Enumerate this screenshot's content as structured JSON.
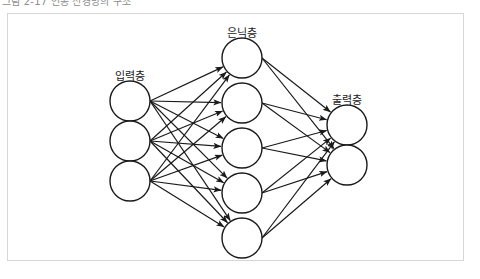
{
  "caption": {
    "text": "그림 2-17 인공 신경망의 구조"
  },
  "figure": {
    "kind": "neural-network-diagram",
    "border_color": "#d6d6d6",
    "background": "#ffffff",
    "stroke_color": "#1a1a1a",
    "node_fill": "#ffffff"
  },
  "labels": {
    "input": "입력층",
    "hidden": "은닉층",
    "output": "출력층"
  },
  "layers": [
    {
      "id": "input",
      "label": "입력층",
      "label_x": 130,
      "label_y": 70,
      "node_count": 3,
      "node_radius": 20,
      "cx": 130,
      "node_cy": [
        101,
        141,
        181
      ]
    },
    {
      "id": "hidden",
      "label": "은닉층",
      "label_x": 242,
      "label_y": 27,
      "node_count": 5,
      "node_radius": 20,
      "cx": 242,
      "node_cy": [
        58,
        103,
        148,
        193,
        238
      ]
    },
    {
      "id": "output",
      "label": "출력층",
      "label_x": 347,
      "label_y": 94,
      "node_count": 2,
      "node_radius": 20,
      "cx": 347,
      "node_cy": [
        125,
        165
      ]
    }
  ],
  "connections": {
    "input_to_hidden": "full",
    "hidden_to_output": "full",
    "arrow_direction": "left-to-right",
    "input_to_hidden_count": 15,
    "hidden_to_output_count": 10
  }
}
